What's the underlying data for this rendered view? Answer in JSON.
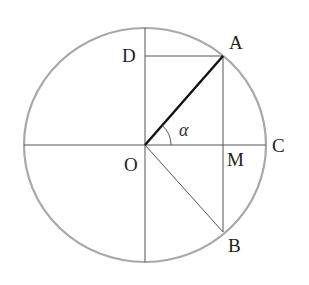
{
  "diagram": {
    "type": "unit-circle-geometry",
    "colors": {
      "circle": "#a8a8a8",
      "thin_line": "#555555",
      "thick_line": "#111111",
      "label": "#222222"
    },
    "circle": {
      "cx": 145,
      "cy": 145,
      "rx": 121,
      "ry": 117
    },
    "points": {
      "O": {
        "x": 145,
        "y": 145
      },
      "A": {
        "x": 223,
        "y": 56
      },
      "B": {
        "x": 223,
        "y": 232
      },
      "C": {
        "x": 266,
        "y": 145
      },
      "D": {
        "x": 145,
        "y": 56
      },
      "M": {
        "x": 223,
        "y": 145
      }
    },
    "labels": {
      "A": "A",
      "B": "B",
      "C": "C",
      "D": "D",
      "M": "M",
      "O": "O",
      "angle": "α"
    },
    "segments": [
      {
        "from": "O",
        "to": "A",
        "style": "thick",
        "name": "radius-OA"
      },
      {
        "from": "O",
        "to": "B",
        "style": "thin",
        "name": "radius-OB"
      },
      {
        "from": "D",
        "to": "A",
        "style": "thin",
        "name": "segment-DA"
      },
      {
        "from": "A",
        "to": "B",
        "style": "thin",
        "name": "chord-AB"
      },
      {
        "from": "left",
        "to": "C",
        "style": "thin",
        "name": "horizontal-diameter"
      },
      {
        "from": "top",
        "to": "bottom",
        "style": "thin",
        "name": "vertical-diameter"
      }
    ],
    "angle_arc": {
      "vertex": "O",
      "from": "C",
      "to": "A",
      "radius": 26,
      "label": "α"
    }
  }
}
